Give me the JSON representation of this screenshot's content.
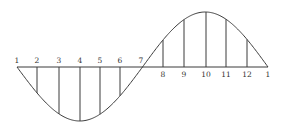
{
  "diagram": {
    "baseline_y": 67,
    "amplitude_down": 54,
    "amplitude_up": 55,
    "x_start": 17,
    "x_end": 268,
    "points": [
      {
        "label": "1",
        "x": 17
      },
      {
        "label": "2",
        "x": 37
      },
      {
        "label": "3",
        "x": 59
      },
      {
        "label": "4",
        "x": 80
      },
      {
        "label": "5",
        "x": 100
      },
      {
        "label": "6",
        "x": 120
      },
      {
        "label": "7",
        "x": 143
      },
      {
        "label": "8",
        "x": 163
      },
      {
        "label": "9",
        "x": 184
      },
      {
        "label": "10",
        "x": 206
      },
      {
        "label": "11",
        "x": 226
      },
      {
        "label": "12",
        "x": 247
      },
      {
        "label": "1",
        "x": 268
      }
    ],
    "colors": {
      "ink": "#3a3a3a",
      "label": "#333333",
      "background": "#ffffff"
    }
  }
}
